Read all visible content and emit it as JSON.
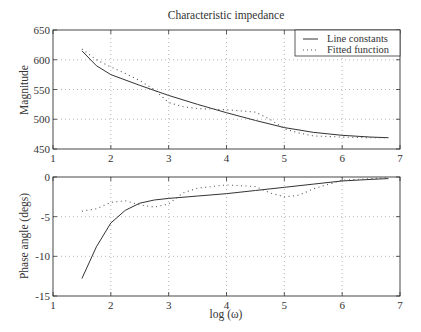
{
  "chart_data": [
    {
      "type": "line",
      "title": "Characteristic impedance",
      "xlabel": "",
      "ylabel": "Magnitude",
      "xlim": [
        1,
        7
      ],
      "ylim": [
        450,
        650
      ],
      "xticks": [
        1,
        2,
        3,
        4,
        5,
        6,
        7
      ],
      "yticks": [
        450,
        500,
        550,
        600,
        650
      ],
      "grid": true,
      "legend_position": "upper right",
      "series": [
        {
          "name": "Line constants",
          "style": "solid",
          "x": [
            1.5,
            1.75,
            2,
            2.5,
            3,
            3.5,
            4,
            4.5,
            5,
            5.5,
            6,
            6.5,
            6.8
          ],
          "y": [
            615,
            590,
            575,
            557,
            540,
            525,
            511,
            498,
            486,
            478,
            473,
            470,
            469
          ]
        },
        {
          "name": "Fitted function",
          "style": "dotted",
          "x": [
            1.5,
            1.75,
            2,
            2.25,
            2.5,
            2.75,
            3,
            3.25,
            3.5,
            4,
            4.5,
            4.75,
            5,
            5.25,
            5.5,
            6,
            6.5,
            6.8
          ],
          "y": [
            618,
            600,
            588,
            577,
            565,
            550,
            528,
            521,
            518,
            516,
            512,
            500,
            484,
            477,
            472,
            470,
            469,
            469
          ]
        }
      ]
    },
    {
      "type": "line",
      "title": "",
      "xlabel": "log (ω)",
      "ylabel": "Phase angle (degs)",
      "xlim": [
        1,
        7
      ],
      "ylim": [
        -15,
        0
      ],
      "xticks": [
        1,
        2,
        3,
        4,
        5,
        6,
        7
      ],
      "yticks": [
        -15,
        -10,
        -5,
        0
      ],
      "grid": true,
      "series": [
        {
          "name": "Line constants",
          "style": "solid",
          "x": [
            1.5,
            1.75,
            2,
            2.25,
            2.5,
            2.75,
            3,
            3.5,
            4,
            4.5,
            5,
            5.5,
            6,
            6.5,
            6.8
          ],
          "y": [
            -12.8,
            -8.8,
            -5.8,
            -4.2,
            -3.3,
            -2.9,
            -2.7,
            -2.4,
            -2.1,
            -1.7,
            -1.3,
            -0.9,
            -0.5,
            -0.3,
            -0.2
          ]
        },
        {
          "name": "Fitted function",
          "style": "dotted",
          "x": [
            1.5,
            1.75,
            2,
            2.25,
            2.5,
            2.75,
            3,
            3.25,
            3.5,
            4,
            4.5,
            4.75,
            5,
            5.25,
            5.5,
            6,
            6.5,
            6.8
          ],
          "y": [
            -4.3,
            -4.0,
            -3.2,
            -3.0,
            -3.5,
            -3.8,
            -3.4,
            -2.0,
            -1.4,
            -1.0,
            -1.2,
            -2.0,
            -2.5,
            -2.3,
            -1.5,
            -0.4,
            -0.2,
            -0.1
          ]
        }
      ]
    }
  ],
  "labels": {
    "title": "Characteristic impedance",
    "top_ylabel": "Magnitude",
    "bottom_ylabel": "Phase angle (degs)",
    "xlabel": "log (ω)",
    "legend_line": "Line constants",
    "legend_fit": "Fitted function"
  }
}
